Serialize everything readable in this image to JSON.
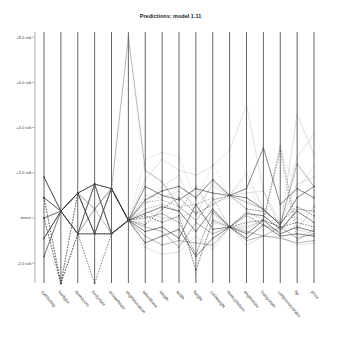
{
  "chart_data": {
    "type": "parallel-coordinates",
    "title": "Predictions: model 1.11",
    "xlabel": "",
    "ylabel": "",
    "y_ticks": [
      {
        "label": "+8.0 std",
        "value": 8
      },
      {
        "label": "+6.0 std",
        "value": 6
      },
      {
        "label": "+4.0 std",
        "value": 4
      },
      {
        "label": "+2.0 std",
        "value": 2
      },
      {
        "label": "mean",
        "value": 0
      },
      {
        "label": "-2.0 std",
        "value": -2
      }
    ],
    "ylim": [
      -3.0,
      8.3
    ],
    "grid": false,
    "legend": "none",
    "axes": [
      "symboling",
      "fueltype",
      "numdoors",
      "bodystyle",
      "drivewheels",
      "enginelocation",
      "wheelbase",
      "length",
      "width",
      "height",
      "curbweight",
      "numcylinders",
      "enginesize",
      "fuelsystem",
      "compressionratio",
      "hp",
      "price"
    ],
    "series": [
      {
        "name": "s1",
        "style": "solid",
        "shade": "dark",
        "values": [
          1.8,
          0.3,
          1.1,
          1.5,
          1.3,
          -0.1,
          0.8,
          1.2,
          1.4,
          0.9,
          1.7,
          1.0,
          1.3,
          3.1,
          0.6,
          1.3,
          0.9
        ]
      },
      {
        "name": "s2",
        "style": "solid",
        "shade": "dark",
        "values": [
          0.9,
          0.3,
          -0.7,
          1.5,
          -0.7,
          -0.1,
          0.2,
          0.5,
          0.3,
          -0.6,
          0.4,
          -0.4,
          0.2,
          0.1,
          -0.5,
          0.3,
          -0.2
        ]
      },
      {
        "name": "s3",
        "style": "solid",
        "shade": "dark",
        "values": [
          0.0,
          0.3,
          1.1,
          -0.7,
          1.3,
          -0.1,
          -0.6,
          -0.4,
          -0.9,
          0.6,
          -0.5,
          -0.4,
          -0.7,
          -0.1,
          -0.7,
          -0.4,
          -0.6
        ]
      },
      {
        "name": "s4",
        "style": "solid",
        "shade": "dark",
        "values": [
          -0.9,
          0.3,
          -0.7,
          -0.7,
          -0.7,
          -0.1,
          1.4,
          1.0,
          0.8,
          1.3,
          1.1,
          1.0,
          0.9,
          0.4,
          -0.3,
          0.9,
          1.4
        ]
      },
      {
        "name": "s5",
        "style": "solid",
        "shade": "dark",
        "values": [
          -1.7,
          0.3,
          1.1,
          1.5,
          1.3,
          -0.1,
          -1.1,
          -0.8,
          -0.5,
          -1.7,
          -0.9,
          -0.4,
          -0.9,
          -0.3,
          -0.8,
          -0.7,
          -0.8
        ]
      },
      {
        "name": "s6",
        "style": "dashed",
        "shade": "dark",
        "values": [
          0.9,
          -2.9,
          -0.7,
          -2.9,
          -0.7,
          -0.1,
          0.1,
          -0.2,
          0.1,
          -2.3,
          -0.1,
          -0.4,
          -0.2,
          -0.1,
          -0.4,
          -0.2,
          -0.4
        ]
      },
      {
        "name": "s7",
        "style": "dashed",
        "shade": "dark",
        "values": [
          0.0,
          -2.9,
          1.1,
          -0.7,
          -0.7,
          -0.1,
          -0.3,
          0.4,
          0.9,
          0.2,
          0.6,
          1.0,
          0.4,
          0.3,
          -0.2,
          0.5,
          0.1
        ]
      },
      {
        "name": "s8",
        "style": "solid",
        "shade": "mid",
        "values": [
          -0.9,
          0.3,
          -0.7,
          0.4,
          1.3,
          8.0,
          2.1,
          1.6,
          0.5,
          -0.1,
          0.8,
          1.0,
          0.7,
          0.4,
          -0.3,
          2.4,
          1.4
        ]
      },
      {
        "name": "s9",
        "style": "solid",
        "shade": "light",
        "values": [
          1.8,
          0.3,
          1.1,
          -0.7,
          -0.7,
          -0.1,
          1.7,
          2.6,
          2.1,
          1.9,
          2.3,
          3.0,
          5.0,
          1.2,
          -0.5,
          4.6,
          2.8
        ]
      },
      {
        "name": "s10",
        "style": "solid",
        "shade": "light",
        "values": [
          0.0,
          0.3,
          -0.7,
          1.5,
          -0.7,
          -0.1,
          0.6,
          1.4,
          1.9,
          0.1,
          1.6,
          1.0,
          2.0,
          0.4,
          -0.3,
          2.7,
          3.7
        ]
      },
      {
        "name": "s11",
        "style": "dashed",
        "shade": "light",
        "values": [
          -0.9,
          -2.9,
          -0.7,
          -0.7,
          1.3,
          -0.1,
          2.6,
          2.9,
          2.7,
          0.8,
          2.4,
          1.0,
          1.8,
          -0.1,
          3.1,
          1.2,
          2.3
        ]
      },
      {
        "name": "s12",
        "style": "solid",
        "shade": "mid",
        "values": [
          0.9,
          0.3,
          1.1,
          0.4,
          1.3,
          -0.1,
          -0.8,
          -1.2,
          -1.0,
          -1.1,
          -1.2,
          -0.4,
          -1.0,
          -0.8,
          -0.9,
          -1.1,
          -1.0
        ]
      },
      {
        "name": "s13",
        "style": "solid",
        "shade": "mid",
        "values": [
          1.8,
          0.3,
          -0.7,
          1.5,
          -0.7,
          -0.1,
          0.0,
          0.2,
          -0.2,
          -1.6,
          0.3,
          -0.4,
          0.1,
          -0.3,
          -0.6,
          0.4,
          0.3
        ]
      },
      {
        "name": "s14",
        "style": "dashed",
        "shade": "mid",
        "values": [
          0.0,
          -2.9,
          -0.7,
          -0.7,
          -0.7,
          -0.1,
          0.4,
          0.6,
          0.3,
          1.4,
          0.2,
          -0.4,
          -0.4,
          -0.1,
          3.0,
          -1.0,
          -0.5
        ]
      },
      {
        "name": "s15",
        "style": "solid",
        "shade": "mid",
        "values": [
          -0.9,
          0.3,
          1.1,
          -0.7,
          1.3,
          -0.1,
          -0.4,
          -0.6,
          -1.3,
          -0.2,
          -0.7,
          -0.4,
          -0.6,
          -0.8,
          -0.4,
          -0.9,
          -0.7
        ]
      },
      {
        "name": "s16",
        "style": "solid",
        "shade": "light",
        "values": [
          0.9,
          0.3,
          -0.7,
          0.4,
          -0.7,
          -0.1,
          1.0,
          0.9,
          1.2,
          0.5,
          1.4,
          1.0,
          1.1,
          1.2,
          -0.2,
          1.5,
          1.8
        ]
      },
      {
        "name": "s17",
        "style": "dashed",
        "shade": "light",
        "values": [
          0.0,
          0.3,
          1.1,
          1.5,
          -0.7,
          -0.1,
          -0.2,
          -0.1,
          0.6,
          -2.5,
          0.0,
          -0.4,
          -0.3,
          0.4,
          -0.5,
          0.0,
          -0.3
        ]
      },
      {
        "name": "s18",
        "style": "solid",
        "shade": "light",
        "values": [
          -1.7,
          0.3,
          -0.7,
          -0.7,
          1.3,
          -0.1,
          -1.3,
          -1.6,
          -1.5,
          -0.8,
          -1.4,
          -0.4,
          -1.2,
          -0.8,
          -0.8,
          -1.2,
          -1.1
        ]
      },
      {
        "name": "s19",
        "style": "solid",
        "shade": "light",
        "values": [
          1.8,
          0.3,
          1.1,
          -0.7,
          1.3,
          -0.1,
          0.3,
          0.0,
          0.0,
          0.3,
          -0.2,
          -0.4,
          -0.5,
          -0.1,
          -0.4,
          -0.5,
          -0.7
        ]
      },
      {
        "name": "s20",
        "style": "dashed",
        "shade": "mid",
        "values": [
          0.9,
          -2.9,
          1.1,
          0.4,
          -0.7,
          -0.1,
          0.7,
          0.8,
          0.5,
          0.6,
          0.9,
          -0.4,
          0.3,
          -0.1,
          3.2,
          -0.5,
          0.5
        ]
      }
    ]
  }
}
